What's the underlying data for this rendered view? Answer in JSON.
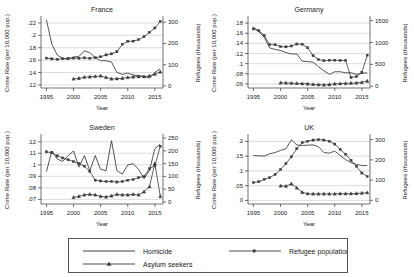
{
  "figure": {
    "shared_xlabel": "Year",
    "shared_ylabel_left": "Crime Rate (per 10,000 pop.)",
    "shared_ylabel_right": "Refugees (thousands)"
  },
  "legend": {
    "items": [
      {
        "label": "Homicide",
        "marker": "none",
        "color": "#2b2b2b"
      },
      {
        "label": "Refugee population",
        "marker": "square",
        "color": "#3a3a3a"
      },
      {
        "label": "Asylum seekers",
        "marker": "triangle",
        "color": "#3a3a3a"
      }
    ]
  },
  "chart_data": [
    {
      "type": "line",
      "title": "France",
      "xlabel": "Year",
      "ylabel": "Crime Rate (per 10,000 pop.)",
      "ylabel_right": "Refugees (thousands)",
      "xlim": [
        1994,
        2016.5
      ],
      "xticks": [
        1995,
        2000,
        2005,
        2010,
        2015
      ],
      "ylim_left": [
        0.115,
        0.228
      ],
      "yticks_left": [
        0.12,
        0.14,
        0.16,
        0.18,
        0.2,
        0.22
      ],
      "ytick_labels_left": [
        ".12",
        ".14",
        ".16",
        ".18",
        ".2",
        ".22"
      ],
      "ylim_right": [
        -10,
        320
      ],
      "yticks_right": [
        0,
        100,
        200,
        300
      ],
      "ytick_labels_right": [
        "0",
        "100",
        "200",
        "300"
      ],
      "grid": true,
      "x": [
        1995,
        1996,
        1997,
        1998,
        1999,
        2000,
        2001,
        2002,
        2003,
        2004,
        2005,
        2006,
        2007,
        2008,
        2009,
        2010,
        2011,
        2012,
        2013,
        2014,
        2015,
        2016
      ],
      "series": [
        {
          "name": "Homicide",
          "axis": "left",
          "marker": "none",
          "values": [
            0.225,
            0.186,
            0.168,
            0.163,
            0.161,
            0.165,
            0.166,
            0.175,
            0.172,
            0.164,
            0.159,
            0.159,
            0.157,
            0.14,
            0.137,
            0.139,
            0.136,
            0.135,
            0.134,
            0.131,
            0.14,
            0.146
          ]
        },
        {
          "name": "Refugee population",
          "axis": "right",
          "marker": "square",
          "values": [
            131,
            127,
            125,
            128,
            130,
            131,
            130,
            132,
            130,
            133,
            137,
            146,
            151,
            161,
            196,
            210,
            211,
            218,
            232,
            252,
            273,
            304
          ]
        },
        {
          "name": "Asylum seekers",
          "axis": "right",
          "marker": "triangle",
          "values": [
            null,
            null,
            null,
            null,
            null,
            33,
            36,
            41,
            43,
            45,
            47,
            40,
            33,
            34,
            36,
            40,
            42,
            44,
            44,
            47,
            55,
            66
          ]
        }
      ]
    },
    {
      "type": "line",
      "title": "Germany",
      "xlabel": "Year",
      "ylabel": "Crime Rate (per 10,000 pop.)",
      "ylabel_right": "Refugees (thousands)",
      "xlim": [
        1994,
        2016.5
      ],
      "xticks": [
        1995,
        2000,
        2005,
        2010,
        2015
      ],
      "ylim_left": [
        0.052,
        0.19
      ],
      "yticks_left": [
        0.06,
        0.08,
        0.1,
        0.12,
        0.14,
        0.16,
        0.18
      ],
      "ytick_labels_left": [
        ".06",
        ".08",
        ".1",
        ".12",
        ".14",
        ".16",
        ".18"
      ],
      "ylim_right": [
        -40,
        1560
      ],
      "yticks_right": [
        0,
        500,
        1000,
        1500
      ],
      "ytick_labels_right": [
        "0",
        "500",
        "1000",
        "1500"
      ],
      "grid": true,
      "x": [
        1995,
        1996,
        1997,
        1998,
        1999,
        2000,
        2001,
        2002,
        2003,
        2004,
        2005,
        2006,
        2007,
        2008,
        2009,
        2010,
        2011,
        2012,
        2013,
        2014,
        2015,
        2016
      ],
      "series": [
        {
          "name": "Homicide",
          "axis": "left",
          "marker": "none",
          "values": [
            0.172,
            0.163,
            0.152,
            0.131,
            0.128,
            0.126,
            0.122,
            0.119,
            0.119,
            0.105,
            0.104,
            0.103,
            0.094,
            0.086,
            0.079,
            0.084,
            0.084,
            0.082,
            0.082,
            0.079,
            0.081,
            0.082
          ]
        },
        {
          "name": "Refugee population",
          "axis": "right",
          "marker": "square",
          "values": [
            1310,
            1270,
            1160,
            950,
            950,
            905,
            900,
            920,
            965,
            960,
            880,
            700,
            610,
            585,
            595,
            595,
            590,
            590,
            200,
            220,
            320,
            710
          ]
        },
        {
          "name": "Asylum seekers",
          "axis": "right",
          "marker": "triangle",
          "values": [
            null,
            null,
            null,
            null,
            null,
            80,
            75,
            70,
            65,
            60,
            55,
            45,
            35,
            30,
            40,
            55,
            60,
            65,
            72,
            75,
            90,
            120
          ]
        }
      ]
    },
    {
      "type": "line",
      "title": "Sweden",
      "xlabel": "Year",
      "ylabel": "Crime Rate (per 10,000 pop.)",
      "ylabel_right": "Refugees (thousands)",
      "xlim": [
        1994,
        2016.5
      ],
      "xticks": [
        1995,
        2000,
        2005,
        2010,
        2015
      ],
      "ylim_left": [
        0.066,
        0.125
      ],
      "yticks_left": [
        0.07,
        0.08,
        0.09,
        0.1,
        0.11,
        0.12
      ],
      "ytick_labels_left": [
        ".07",
        ".08",
        ".09",
        ".1",
        ".11",
        ".12"
      ],
      "ylim_right": [
        -8,
        258
      ],
      "yticks_right": [
        0,
        50,
        100,
        150,
        200,
        250
      ],
      "ytick_labels_right": [
        "0",
        "50",
        "100",
        "150",
        "200",
        "250"
      ],
      "grid": true,
      "x": [
        1995,
        1996,
        1997,
        1998,
        1999,
        2000,
        2001,
        2002,
        2003,
        2004,
        2005,
        2006,
        2007,
        2008,
        2009,
        2010,
        2011,
        2012,
        2013,
        2014,
        2015,
        2016
      ],
      "series": [
        {
          "name": "Homicide",
          "axis": "left",
          "marker": "none",
          "values": [
            0.094,
            0.112,
            0.105,
            0.103,
            0.108,
            0.112,
            0.098,
            0.108,
            0.095,
            0.108,
            0.096,
            0.095,
            0.121,
            0.095,
            0.092,
            0.1,
            0.101,
            0.096,
            0.088,
            0.095,
            0.114,
            0.118
          ]
        },
        {
          "name": "Refugee population",
          "axis": "right",
          "marker": "square",
          "values": [
            196,
            193,
            180,
            172,
            165,
            158,
            150,
            140,
            120,
            85,
            82,
            80,
            80,
            78,
            80,
            85,
            88,
            95,
            100,
            130,
            142,
            218
          ]
        },
        {
          "name": "Asylum seekers",
          "axis": "right",
          "marker": "triangle",
          "values": [
            null,
            null,
            null,
            null,
            null,
            18,
            22,
            28,
            30,
            28,
            22,
            20,
            24,
            30,
            28,
            28,
            30,
            28,
            40,
            60,
            150,
            22
          ]
        }
      ]
    },
    {
      "type": "line",
      "title": "UK",
      "xlabel": "Year",
      "ylabel": "Crime Rate (per 10,000 pop.)",
      "ylabel_right": "Refugees (thousands)",
      "xlim": [
        1994,
        2016.5
      ],
      "xticks": [
        1995,
        2000,
        2005,
        2010,
        2015
      ],
      "ylim_left": [
        -0.012,
        0.218
      ],
      "yticks_left": [
        0,
        0.05,
        0.1,
        0.15,
        0.2
      ],
      "ytick_labels_left": [
        "0",
        ".05",
        ".1",
        ".15",
        ".2"
      ],
      "ylim_right": [
        -18,
        318
      ],
      "yticks_right": [
        0,
        100,
        200,
        300
      ],
      "ytick_labels_right": [
        "0",
        "100",
        "200",
        "300"
      ],
      "grid": true,
      "x": [
        1995,
        1996,
        1997,
        1998,
        1999,
        2000,
        2001,
        2002,
        2003,
        2004,
        2005,
        2006,
        2007,
        2008,
        2009,
        2010,
        2011,
        2012,
        2013,
        2014,
        2015,
        2016
      ],
      "series": [
        {
          "name": "Homicide",
          "axis": "left",
          "marker": "none",
          "values": [
            0.152,
            0.151,
            0.15,
            0.158,
            0.162,
            0.169,
            0.175,
            0.205,
            0.188,
            0.186,
            0.187,
            0.188,
            0.182,
            0.162,
            0.16,
            0.167,
            0.152,
            0.138,
            0.128,
            0.122,
            0.118,
            0.118
          ]
        },
        {
          "name": "Refugee population",
          "axis": "right",
          "marker": "square",
          "values": [
            88,
            92,
            104,
            112,
            128,
            152,
            182,
            215,
            255,
            285,
            292,
            298,
            300,
            298,
            292,
            278,
            252,
            228,
            198,
            168,
            135,
            118
          ]
        },
        {
          "name": "Asylum seekers",
          "axis": "right",
          "marker": "triangle",
          "values": [
            null,
            null,
            null,
            null,
            null,
            72,
            70,
            82,
            62,
            40,
            33,
            32,
            32,
            32,
            32,
            32,
            33,
            33,
            33,
            34,
            36,
            38
          ]
        }
      ]
    }
  ]
}
